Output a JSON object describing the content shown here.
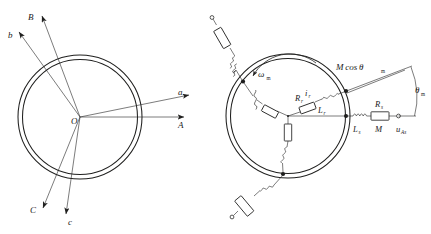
{
  "figure": {
    "ink_color": "#20201f",
    "background": "#ffffff"
  },
  "left_diagram": {
    "name": "stator-rotor-axes-diagram",
    "center_label": "O",
    "axes": [
      {
        "id": "axis-a-lower",
        "label": "a",
        "case": "lower"
      },
      {
        "id": "axis-A-upper",
        "label": "A",
        "case": "upper"
      },
      {
        "id": "axis-b-lower",
        "label": "b",
        "case": "lower"
      },
      {
        "id": "axis-B-upper",
        "label": "B",
        "case": "upper"
      },
      {
        "id": "axis-c-lower",
        "label": "c",
        "case": "lower"
      },
      {
        "id": "axis-C-upper",
        "label": "C",
        "case": "upper"
      }
    ]
  },
  "right_diagram": {
    "name": "rotor-circuit-diagram",
    "rotation_symbol": "ω",
    "rotation_subscript": "m",
    "mutual_inductance_label": "M cosθ",
    "mutual_inductance_base": "M cos θ",
    "mutual_subscript": "m",
    "angle_label": "θ",
    "angle_subscript": "m",
    "components": [
      {
        "id": "rotor-resistance",
        "symbol": "R",
        "subscript": "r"
      },
      {
        "id": "rotor-inductance",
        "symbol": "L",
        "subscript": "r"
      },
      {
        "id": "rotor-current",
        "symbol": "i",
        "subscript": "r"
      },
      {
        "id": "stator-inductance",
        "symbol": "L",
        "subscript": "s"
      },
      {
        "id": "stator-resistance",
        "symbol": "R",
        "subscript": "s"
      },
      {
        "id": "mutual-M",
        "symbol": "M",
        "subscript": ""
      },
      {
        "id": "stator-voltage",
        "symbol": "u",
        "subscript": "As"
      }
    ],
    "external_branches": [
      {
        "id": "external-branch-top",
        "elements": [
          "coil",
          "resistor",
          "terminal"
        ]
      },
      {
        "id": "external-branch-bottom",
        "elements": [
          "coil",
          "resistor",
          "terminal"
        ]
      }
    ],
    "internal_phases": [
      {
        "id": "phase-upper-right",
        "elements": [
          "resistor",
          "coil"
        ]
      },
      {
        "id": "phase-upper-left",
        "elements": [
          "resistor",
          "coil"
        ]
      },
      {
        "id": "phase-lower",
        "elements": [
          "resistor",
          "coil"
        ]
      }
    ]
  }
}
